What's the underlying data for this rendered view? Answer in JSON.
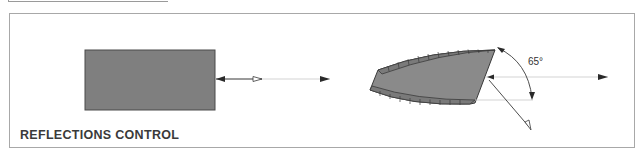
{
  "figure": {
    "caption": "REFLECTIONS CONTROL",
    "angle_label": "65°",
    "elements": [
      {
        "name": "flat-panel",
        "shape": "rectangle",
        "fill": "#7f7f7f",
        "description": "flat surface reflecting incident ray straight back"
      },
      {
        "name": "incident-ray-left",
        "shape": "arrow",
        "description": "ray hitting flat panel, reflected back"
      },
      {
        "name": "angled-panel",
        "shape": "curved-wedge",
        "fill": "#7f7f7f",
        "description": "shaped surface angled to deflect reflection"
      },
      {
        "name": "incident-ray-right",
        "shape": "arrow",
        "description": "ray hitting angled surface"
      },
      {
        "name": "deflected-ray",
        "shape": "arrow",
        "description": "ray deflected downward away from source"
      },
      {
        "name": "angle-arc",
        "shape": "arc",
        "value": "65°"
      }
    ]
  },
  "colors": {
    "fill": "#7f7f7f",
    "stroke": "#3a3a3a",
    "line": "#bdbdbd",
    "border": "#a8a8a8"
  }
}
